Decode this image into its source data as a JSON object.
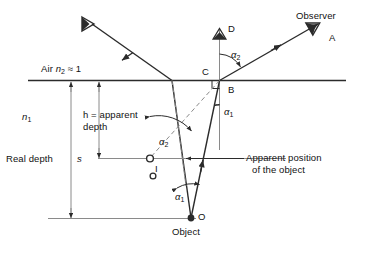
{
  "figure": {
    "background_color": "#ffffff",
    "line_color": "#2b2b2b",
    "text_color": "#111111"
  },
  "media": {
    "upper_label": "Air",
    "upper_index_symbol": "n",
    "upper_index_subscript": "2",
    "upper_index_relation": "≈ 1",
    "upper_full": "Air n2 ≈ 1",
    "lower_index_symbol": "n",
    "lower_index_subscript": "1"
  },
  "depths": {
    "apparent_line1": "h = apparent",
    "apparent_line2": "depth",
    "apparent_symbol": "h",
    "real_label": "Real depth",
    "real_symbol": "s"
  },
  "points": {
    "object": "O",
    "object_caption": "Object",
    "image": "I",
    "surface_point": "B",
    "normal_foot": "C",
    "normal_top": "D",
    "ray_tip": "A",
    "observer": "Observer"
  },
  "angles": {
    "incidence": "α",
    "incidence_subscript": "1",
    "refraction": "β",
    "refraction_subscript": "2",
    "alpha1_full": "α1",
    "alpha2_full": "α2",
    "alpha2_at_image": "α2",
    "alpha2_at_surface": "α2",
    "alpha1_at_object": "α1"
  },
  "annotations": {
    "apparent_position_line1": "Apparent position",
    "apparent_position_line2": "of the object"
  },
  "icons": {
    "eye_left": "eye-icon",
    "eye_top": "eye-icon",
    "eye_right": "eye-icon"
  }
}
